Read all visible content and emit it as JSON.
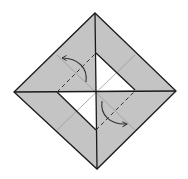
{
  "diagram": {
    "type": "origami-fold-step",
    "colors": {
      "paper": "#c4c4c4",
      "background": "#ffffff",
      "line": "#1a1a1a",
      "crease": "#9a9a9a",
      "valley_fold": "#333333"
    },
    "outer_square": {
      "top": [
        95,
        13
      ],
      "right": [
        176,
        91
      ],
      "bottom": [
        97,
        169
      ],
      "left": [
        14,
        92
      ]
    },
    "inner_window": {
      "top": [
        96,
        53
      ],
      "right": [
        135,
        90
      ],
      "bottom": [
        96,
        130
      ],
      "left": [
        57,
        92
      ]
    },
    "annotations": [
      {
        "name": "valley-fold-upper-left",
        "kind": "dashed-line-with-curved-arrow"
      },
      {
        "name": "valley-fold-lower-right",
        "kind": "dashed-line-with-curved-arrow"
      }
    ]
  }
}
